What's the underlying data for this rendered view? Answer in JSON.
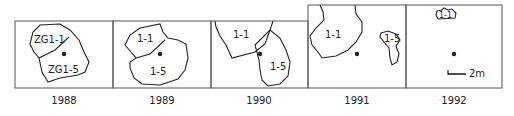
{
  "panels": [
    {
      "year": "1988",
      "labels": [
        "ZG1-1",
        "ZG1-5"
      ]
    },
    {
      "year": "1989",
      "labels": [
        "1-1",
        "1-5"
      ]
    },
    {
      "year": "1990",
      "labels": [
        "1-1",
        "1-5"
      ]
    },
    {
      "year": "1991",
      "labels": [
        "1-1",
        "1-5"
      ]
    },
    {
      "year": "1992",
      "labels": [
        "1-1"
      ]
    }
  ],
  "scale_bar": {
    "label": "2m"
  },
  "colors": {
    "stroke": "#222222",
    "frame": "#555555"
  }
}
